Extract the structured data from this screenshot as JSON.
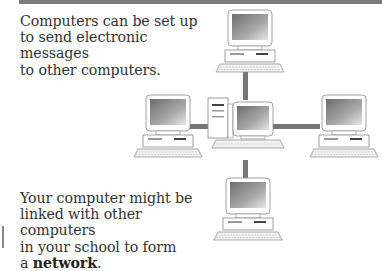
{
  "page": {
    "top_rule_color": "#7a7a7a"
  },
  "text": {
    "intro_line1": "Computers can be set up",
    "intro_line2": "to send electronic messages",
    "intro_line3": "to other computers.",
    "body_line1": "Your computer might be",
    "body_line2": "linked with other computers",
    "body_line3": "in your school to form",
    "body_prefix": "a ",
    "body_keyword": "network",
    "body_suffix": "."
  },
  "diagram": {
    "nodes": [
      {
        "name": "top-computer",
        "type": "desktop"
      },
      {
        "name": "left-computer",
        "type": "desktop"
      },
      {
        "name": "center-computer",
        "type": "tower-server"
      },
      {
        "name": "right-computer",
        "type": "desktop"
      },
      {
        "name": "bottom-computer",
        "type": "desktop"
      }
    ],
    "cable_color": "#777777"
  }
}
